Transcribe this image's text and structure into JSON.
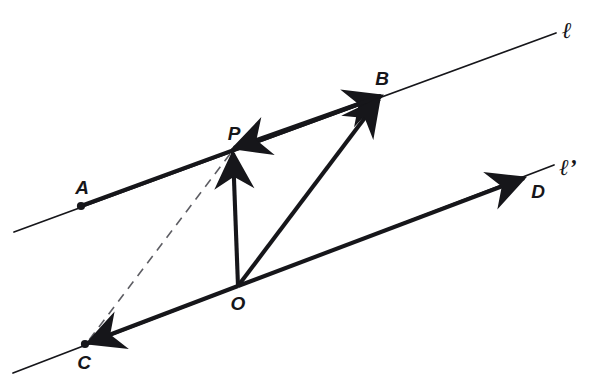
{
  "figure": {
    "type": "vector-geometry-diagram",
    "background_color": "#ffffff",
    "ink_color": "#16161a",
    "width": 592,
    "height": 390
  },
  "lines": [
    {
      "name": "line-l",
      "label": "ℓ",
      "label_x": 567,
      "label_y": 30,
      "from_x": 14,
      "from_y": 232,
      "to_x": 556,
      "to_y": 33,
      "style": "solid-thin"
    },
    {
      "name": "line-l-prime",
      "label": "ℓ’",
      "label_x": 568,
      "label_y": 167,
      "from_x": 13,
      "from_y": 373,
      "to_x": 554,
      "to_y": 165,
      "style": "solid-thin"
    }
  ],
  "points": [
    {
      "name": "A",
      "label": "A",
      "x": 81,
      "y": 206,
      "dot": true,
      "label_x": 82,
      "label_y": 187
    },
    {
      "name": "P",
      "label": "P",
      "x": 232,
      "y": 150,
      "dot": false,
      "label_x": 234,
      "label_y": 133
    },
    {
      "name": "B",
      "label": "B",
      "x": 381,
      "y": 96,
      "dot": false,
      "label_x": 382,
      "label_y": 78
    },
    {
      "name": "C",
      "label": "C",
      "x": 85,
      "y": 344,
      "dot": true,
      "label_x": 84,
      "label_y": 362
    },
    {
      "name": "O",
      "label": "O",
      "x": 238,
      "y": 286,
      "dot": false,
      "label_x": 238,
      "label_y": 303
    },
    {
      "name": "D",
      "label": "D",
      "x": 524,
      "y": 178,
      "dot": false,
      "label_x": 538,
      "label_y": 191
    }
  ],
  "vectors": [
    {
      "name": "vector-A-to-B",
      "from": "A",
      "to": "B",
      "from_x": 81,
      "from_y": 206,
      "to_x": 381,
      "to_y": 96,
      "arrow": "head",
      "style": "solid-thick"
    },
    {
      "name": "vector-B-to-P",
      "from": "B",
      "to": "P",
      "from_x": 381,
      "from_y": 96,
      "to_x": 234,
      "to_y": 148,
      "arrow": "head",
      "style": "solid-thick"
    },
    {
      "name": "vector-O-to-P",
      "from": "O",
      "to": "P",
      "from_x": 238,
      "from_y": 286,
      "to_x": 233,
      "to_y": 153,
      "arrow": "head",
      "style": "solid-thick"
    },
    {
      "name": "vector-O-to-B",
      "from": "O",
      "to": "B",
      "from_x": 238,
      "from_y": 286,
      "to_x": 379,
      "to_y": 99,
      "arrow": "head",
      "style": "solid-thick"
    },
    {
      "name": "vector-O-to-D",
      "from": "O",
      "to": "D",
      "from_x": 238,
      "from_y": 286,
      "to_x": 524,
      "to_y": 178,
      "arrow": "head",
      "style": "solid-thick"
    },
    {
      "name": "vector-O-to-C",
      "from": "O",
      "to": "C",
      "from_x": 238,
      "from_y": 286,
      "to_x": 88,
      "to_y": 343,
      "arrow": "head",
      "style": "solid-thick"
    },
    {
      "name": "segment-P-to-C",
      "from": "P",
      "to": "C",
      "from_x": 230,
      "from_y": 154,
      "to_x": 86,
      "to_y": 344,
      "arrow": "none",
      "style": "dashed-thin"
    }
  ]
}
